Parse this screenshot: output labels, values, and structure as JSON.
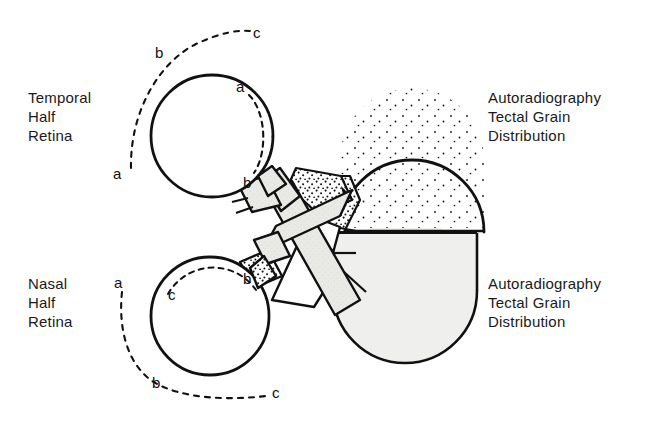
{
  "figure": {
    "background_color": "#ffffff",
    "ink_color": "#111111",
    "stipple_color": "#1a1a1a",
    "tint_color": "#e8e8e6",
    "width": 658,
    "height": 424
  },
  "labels": {
    "temporal_retina": {
      "line1": "Temporal",
      "line2": "Half",
      "line3": "Retina"
    },
    "nasal_retina": {
      "line1": "Nasal",
      "line2": "Half",
      "line3": "Retina"
    },
    "autoradiography_top": {
      "line1": "Autoradiography",
      "line2": "Tectal Grain",
      "line3": "Distribution"
    },
    "autoradiography_bottom": {
      "line1": "Autoradiography",
      "line2": "Tectal Grain",
      "line3": "Distribution"
    }
  },
  "markers": {
    "upper_outer_arc": {
      "a": "a",
      "b": "b",
      "c": "c"
    },
    "upper_inner_arc": {
      "a": "a",
      "b": "b"
    },
    "lower_outer_arc": {
      "a": "a",
      "b": "b",
      "c": "c"
    },
    "lower_inner_arc": {
      "b": "b",
      "c": "c"
    }
  },
  "structures": {
    "upper_left_eye": {
      "name": "Temporal half retina eye",
      "cx": 212,
      "cy": 136,
      "r": 61,
      "fill": "none",
      "hatched_sector": "lower-left",
      "stippled_band": "right margin"
    },
    "lower_left_eye": {
      "name": "Nasal half retina eye",
      "cx": 210,
      "cy": 316,
      "r": 59,
      "fill": "none",
      "hatched_sector": "right",
      "stippled_band": "upper margin"
    },
    "upper_right_tectum": {
      "name": "Tectum with dense autoradiographic grain",
      "cx": 412,
      "cy": 160,
      "r": 72,
      "fill": "stipple-gradient"
    },
    "lower_right_tectum": {
      "name": "Tectum with uniform light tint",
      "cx": 405,
      "cy": 291,
      "r": 72,
      "fill": "#efefed"
    },
    "chiasm": {
      "name": "Optic chiasm crossing",
      "cx": 300,
      "cy": 222
    }
  }
}
